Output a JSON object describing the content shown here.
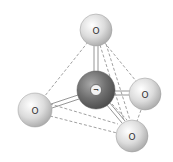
{
  "diagram": {
    "type": "tetrahedral-molecule",
    "central_atom": {
      "label": "¬",
      "x": 96,
      "y": 90,
      "r": 19,
      "color": "#6e6e6e"
    },
    "outer_atoms": [
      {
        "id": "top",
        "label": "O",
        "x": 96,
        "y": 30,
        "r": 16,
        "color": "#d9d9d9"
      },
      {
        "id": "left",
        "label": "O",
        "x": 35,
        "y": 110,
        "r": 17,
        "color": "#d9d9d9"
      },
      {
        "id": "right",
        "label": "O",
        "x": 145,
        "y": 94,
        "r": 16,
        "color": "#d9d9d9"
      },
      {
        "id": "bottom",
        "label": "O",
        "x": 132,
        "y": 136,
        "r": 16,
        "color": "#d9d9d9"
      }
    ],
    "bond_style": "double-line",
    "edge_style": "dashed",
    "colors": {
      "bond": "#888888",
      "dashed_edge": "#777777",
      "background": "#ffffff"
    }
  }
}
